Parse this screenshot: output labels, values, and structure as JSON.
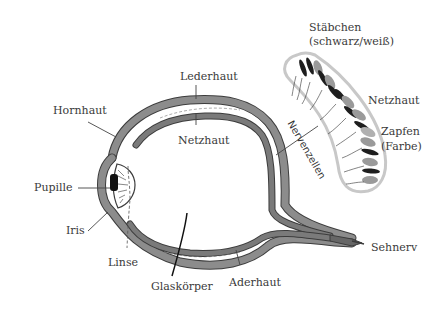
{
  "diagram": {
    "labels": {
      "lederhaut": "Lederhaut",
      "hornhaut": "Hornhaut",
      "netzhaut_eye": "Netzhaut",
      "pupille": "Pupille",
      "iris": "Iris",
      "linse": "Linse",
      "glaskoerper": "Glaskörper",
      "aderhaut": "Aderhaut",
      "sehnerv": "Sehnerv",
      "staebchen_line1": "Stäbchen",
      "staebchen_line2": "(schwarz/weiß)",
      "netzhaut_detail": "Netzhaut",
      "zapfen_line1": "Zapfen",
      "zapfen_line2": "(Farbe)",
      "nervenzellen": "Nervenzellen"
    },
    "colors": {
      "outer_layer": "#8c8c8c",
      "inner_layer": "#7a7a7a",
      "outline": "#3c3c3c",
      "leader_line": "#444444",
      "text": "#3a3a3a",
      "pupil": "#111111",
      "retina_border": "#c8c8c8",
      "rod_dark": "#1e1e1e",
      "cone_gray": "#9a9a9a"
    }
  }
}
